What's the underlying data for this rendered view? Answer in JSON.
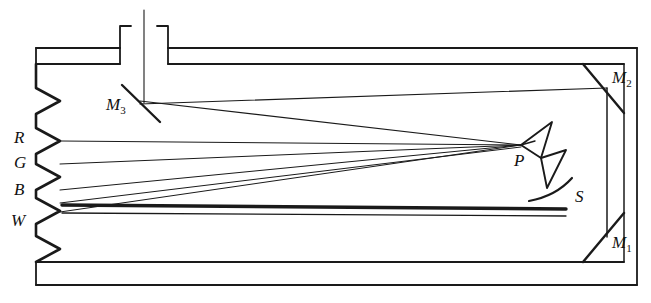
{
  "figure": {
    "type": "optical-ray-diagram",
    "title": "",
    "background_color": "#ffffff",
    "ink_color": "#1a1a1a"
  },
  "labels": {
    "aperture_red": "R",
    "aperture_green": "G",
    "aperture_blue": "B",
    "aperture_white": "W",
    "mirror_one": "M",
    "mirror_one_sub": "1",
    "mirror_two": "M",
    "mirror_two_sub": "2",
    "mirror_three": "M",
    "mirror_three_sub": "3",
    "prism": "P",
    "mirror_curved": "S"
  },
  "components": {
    "outer_housing": "rectangular double-walled enclosure",
    "left_wall": "serrated zigzag wall with five notches",
    "chimney": "vertical entrance tube at top",
    "prism": "bowtie double-triangle prism",
    "curved_mirror": "concave arc mirror",
    "corner_mirror_top": "diagonal mirror in top-right corner",
    "corner_mirror_bottom": "diagonal mirror in bottom-right corner",
    "slit": "bold horizontal slit aperture",
    "ray_count": 6
  },
  "geometry": {
    "width": 651,
    "height": 303,
    "prism_point": [
      521,
      145
    ],
    "mirror3_point": [
      133,
      103
    ],
    "aperture_y": {
      "R": 140,
      "G": 163,
      "B": 190,
      "W": 212
    }
  }
}
